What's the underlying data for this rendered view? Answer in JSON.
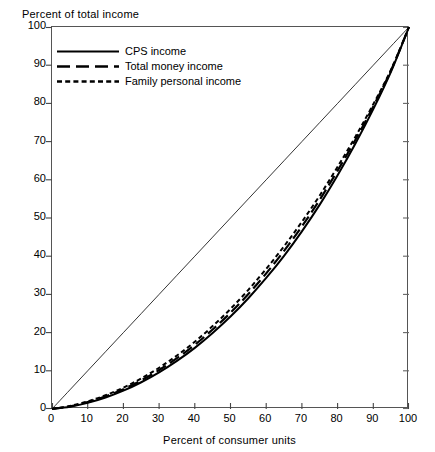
{
  "chart_data": {
    "type": "line",
    "title": "",
    "xlabel": "Percent of consumer units",
    "ylabel": "Percent of total income",
    "xlim": [
      0,
      100
    ],
    "ylim": [
      0,
      100
    ],
    "grid": false,
    "legend_position": "upper-left-inside",
    "xticks": [
      0,
      10,
      20,
      30,
      40,
      50,
      60,
      70,
      80,
      90,
      100
    ],
    "yticks": [
      0,
      10,
      20,
      30,
      40,
      50,
      60,
      70,
      80,
      90,
      100
    ],
    "xtick_labels": [
      "0",
      "10",
      "20",
      "30",
      "40",
      "50",
      "60",
      "70",
      "80",
      "90",
      "100"
    ],
    "ytick_labels": [
      "0",
      "10",
      "20",
      "30",
      "40",
      "50",
      "60",
      "70",
      "80",
      "90",
      "100"
    ],
    "x": [
      0,
      5,
      10,
      15,
      20,
      25,
      30,
      35,
      40,
      45,
      50,
      55,
      60,
      65,
      70,
      75,
      80,
      85,
      90,
      95,
      100
    ],
    "series": [
      {
        "name": "CPS income",
        "style": "solid",
        "color": "#000000",
        "values": [
          0.0,
          0.6,
          1.6,
          3.0,
          4.8,
          7.0,
          9.6,
          12.6,
          16.0,
          19.9,
          24.2,
          29.0,
          34.3,
          40.1,
          46.5,
          53.5,
          61.2,
          69.5,
          78.5,
          88.4,
          100.0
        ]
      },
      {
        "name": "Total money income",
        "style": "long-dash",
        "color": "#000000",
        "values": [
          0.0,
          0.7,
          1.8,
          3.3,
          5.2,
          7.5,
          10.2,
          13.3,
          16.8,
          20.8,
          25.2,
          30.1,
          35.5,
          41.4,
          47.8,
          54.8,
          62.4,
          70.5,
          79.2,
          88.7,
          100.0
        ]
      },
      {
        "name": "Family personal income",
        "style": "short-dash",
        "color": "#000000",
        "values": [
          0.0,
          0.8,
          2.0,
          3.6,
          5.6,
          8.0,
          10.8,
          14.0,
          17.6,
          21.7,
          26.2,
          31.2,
          36.7,
          42.6,
          49.0,
          55.9,
          63.4,
          71.3,
          79.8,
          88.9,
          100.0
        ]
      },
      {
        "name": "line of equality",
        "style": "thin-solid",
        "color": "#000000",
        "values": [
          0,
          5,
          10,
          15,
          20,
          25,
          30,
          35,
          40,
          45,
          50,
          55,
          60,
          65,
          70,
          75,
          80,
          85,
          90,
          95,
          100
        ]
      }
    ],
    "legend_entries": [
      {
        "label": "CPS income",
        "style": "solid"
      },
      {
        "label": "Total money income",
        "style": "long-dash"
      },
      {
        "label": "Family personal income",
        "style": "short-dash"
      }
    ]
  }
}
